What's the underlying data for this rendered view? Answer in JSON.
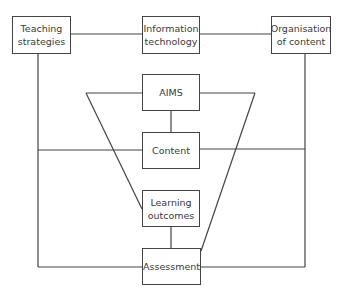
{
  "diagram": {
    "type": "curriculum-model-flow",
    "nodes": [
      {
        "id": "teaching_strategies",
        "label": "Teaching strategies"
      },
      {
        "id": "information_technology",
        "label": "Information technology"
      },
      {
        "id": "organisation_of_content",
        "label": "Organisation of content"
      },
      {
        "id": "aims",
        "label": "AIMS"
      },
      {
        "id": "content",
        "label": "Content"
      },
      {
        "id": "learning_outcomes",
        "label": "Learning outcomes"
      },
      {
        "id": "assessment",
        "label": "Assessment"
      }
    ],
    "edges": [
      [
        "teaching_strategies",
        "information_technology"
      ],
      [
        "information_technology",
        "organisation_of_content"
      ],
      [
        "teaching_strategies",
        "content"
      ],
      [
        "organisation_of_content",
        "content"
      ],
      [
        "teaching_strategies",
        "assessment"
      ],
      [
        "organisation_of_content",
        "assessment"
      ],
      [
        "aims",
        "content"
      ],
      [
        "aims",
        "learning_outcomes"
      ],
      [
        "aims",
        "assessment"
      ],
      [
        "learning_outcomes",
        "assessment"
      ]
    ],
    "labels": {
      "teaching_strategies": "Teaching strategies",
      "information_technology": "Information technology",
      "organisation_of_content": "Organisation of content",
      "aims": "AIMS",
      "content": "Content",
      "learning_outcomes": "Learning outcomes",
      "assessment": "Assessment"
    },
    "line_color": "#444444"
  },
  "caption": {
    "text": ""
  }
}
